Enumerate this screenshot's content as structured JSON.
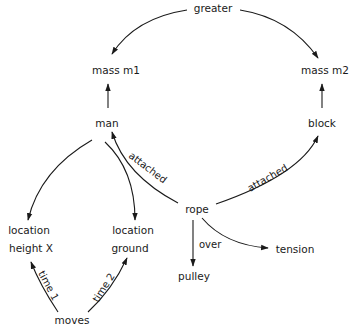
{
  "diagram": {
    "type": "semantic-network",
    "nodes": {
      "greater": "greater",
      "mass_m1": "mass m1",
      "mass_m2": "mass m2",
      "man": "man",
      "block": "block",
      "rope": "rope",
      "location1": "location",
      "height_x": "height X",
      "location2": "location",
      "ground": "ground",
      "pulley": "pulley",
      "tension": "tension",
      "moves": "moves"
    },
    "edge_labels": {
      "attached_man": "attached",
      "attached_block": "attached",
      "over": "over",
      "time1": "time 1",
      "time2": "time 2"
    },
    "edges": [
      {
        "from": "greater",
        "to": "mass m1",
        "label": ""
      },
      {
        "from": "greater",
        "to": "mass m2",
        "label": ""
      },
      {
        "from": "man",
        "to": "mass m1",
        "label": ""
      },
      {
        "from": "block",
        "to": "mass m2",
        "label": ""
      },
      {
        "from": "rope",
        "to": "man",
        "label": "attached"
      },
      {
        "from": "rope",
        "to": "block",
        "label": "attached"
      },
      {
        "from": "man",
        "to": "location / height X",
        "label": ""
      },
      {
        "from": "man",
        "to": "location / ground",
        "label": ""
      },
      {
        "from": "rope",
        "to": "pulley",
        "label": "over"
      },
      {
        "from": "rope",
        "to": "tension",
        "label": ""
      },
      {
        "from": "moves",
        "to": "location / height X",
        "label": "time 1"
      },
      {
        "from": "moves",
        "to": "location / ground",
        "label": "time 2"
      }
    ]
  }
}
